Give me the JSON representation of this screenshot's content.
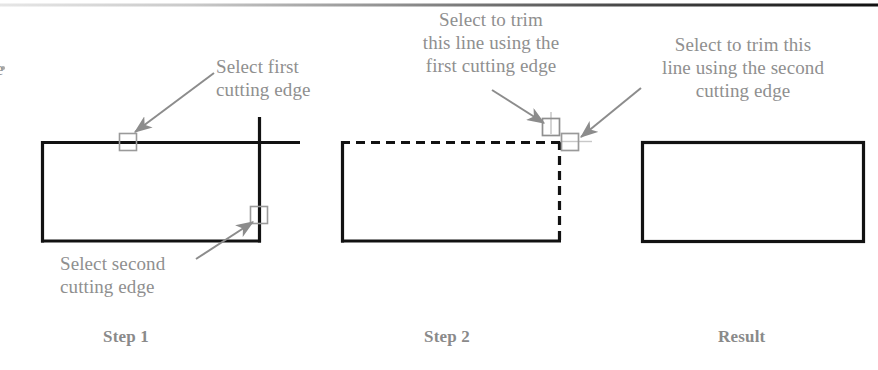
{
  "figure": {
    "type": "diagram",
    "top_rule": {
      "name": "header-rule",
      "y": 5,
      "color_left": "#d8d8d8",
      "color_right": "#1a1a1a"
    },
    "colors": {
      "geometry": "#121212",
      "annotation_text": "#8f8f8f",
      "caption_text": "#8a8a8a",
      "arrow": "#8c8c8c",
      "pickbox": "#9a9a9a",
      "background": "#ffffff"
    }
  },
  "annotations": [
    {
      "id": "select-first-cutting-edge",
      "lines": [
        "Select first",
        "cutting edge"
      ],
      "text": "Select first cutting edge",
      "x": 216,
      "y": 55,
      "align": "left"
    },
    {
      "id": "select-second-cutting-edge",
      "lines": [
        "Select second",
        "cutting edge"
      ],
      "text": "Select second cutting edge",
      "x": 60,
      "y": 252,
      "align": "left"
    },
    {
      "id": "select-to-trim-first",
      "lines": [
        "Select to trim",
        "this line using the",
        "first cutting edge"
      ],
      "text": "Select to trim this line using the first cutting edge",
      "x": 391,
      "y": 8,
      "align": "center"
    },
    {
      "id": "select-to-trim-second",
      "lines": [
        "Select to trim this",
        "line using the second",
        "cutting edge"
      ],
      "text": "Select to trim this line using the second cutting edge",
      "x": 637,
      "y": 33,
      "align": "center"
    }
  ],
  "captions": [
    {
      "id": "caption-step-1",
      "label": "Step 1",
      "x": 103,
      "y": 327
    },
    {
      "id": "caption-step-2",
      "label": "Step 2",
      "x": 424,
      "y": 327
    },
    {
      "id": "caption-result",
      "label": "Result",
      "x": 718,
      "y": 327
    }
  ],
  "panels": [
    {
      "id": "panel-step-1",
      "caption": "Step 1",
      "rect": {
        "x": 41,
        "y": 141,
        "width": 219,
        "height": 101
      },
      "edges": {
        "top": "solid",
        "right": "solid",
        "bottom": "solid",
        "left": "solid"
      },
      "overshoot": {
        "horizontal_right_to": 300,
        "vertical_top_to": 117
      },
      "pickboxes": [
        {
          "id": "pickbox-first-cutting-edge",
          "cx": 128,
          "cy": 142,
          "size": 17
        },
        {
          "id": "pickbox-second-cutting-edge",
          "cx": 259,
          "cy": 215,
          "size": 17
        }
      ]
    },
    {
      "id": "panel-step-2",
      "caption": "Step 2",
      "rect": {
        "x": 341,
        "y": 141,
        "width": 219,
        "height": 101
      },
      "edges": {
        "top": "dashed",
        "right": "dashed",
        "bottom": "solid",
        "left": "solid"
      },
      "pickboxes": [
        {
          "id": "pickbox-trim-first",
          "cx": 551,
          "cy": 127,
          "size": 17
        },
        {
          "id": "pickbox-trim-second",
          "cx": 570,
          "cy": 142,
          "size": 17
        }
      ]
    },
    {
      "id": "panel-result",
      "caption": "Result",
      "rect": {
        "x": 641,
        "y": 141,
        "width": 223,
        "height": 101
      },
      "edges": {
        "top": "solid",
        "right": "solid",
        "bottom": "solid",
        "left": "solid"
      },
      "pickboxes": []
    }
  ],
  "arrows": [
    {
      "id": "arrow-to-first-cutting-edge",
      "from": [
        214,
        73
      ],
      "to": [
        133,
        134
      ]
    },
    {
      "id": "arrow-to-second-cutting-edge",
      "from": [
        196,
        258
      ],
      "to": [
        252,
        222
      ]
    },
    {
      "id": "arrow-to-trim-first",
      "from": [
        492,
        90
      ],
      "to": [
        545,
        122
      ]
    },
    {
      "id": "arrow-to-trim-second",
      "from": [
        640,
        88
      ],
      "to": [
        579,
        137
      ]
    },
    {
      "id": "leader-select-second-cutting-edge",
      "from": [
        196,
        258
      ],
      "to": [
        252,
        222
      ]
    }
  ]
}
